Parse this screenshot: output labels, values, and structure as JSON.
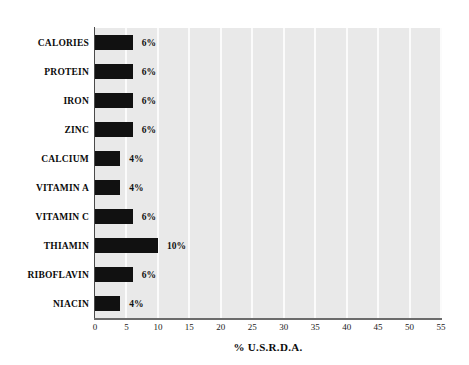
{
  "chart_data": {
    "type": "bar",
    "orientation": "horizontal",
    "title": "",
    "xlabel": "% U.S.R.D.A.",
    "ylabel": "",
    "xlim": [
      0,
      55
    ],
    "xticks": [
      0,
      5,
      10,
      15,
      20,
      25,
      30,
      35,
      40,
      45,
      50,
      55
    ],
    "xtick_labels": [
      "0",
      "5",
      "10",
      "15",
      "20",
      "25",
      "30",
      "35",
      "40",
      "45",
      "50",
      "55"
    ],
    "grid": "vertical-white-gridlines-every-5-units",
    "legend": "none",
    "categories": [
      "CALORIES",
      "PROTEIN",
      "IRON",
      "ZINC",
      "CALCIUM",
      "VITAMIN A",
      "VITAMIN C",
      "THIAMIN",
      "RIBOFLAVIN",
      "NIACIN"
    ],
    "values": [
      6,
      6,
      6,
      6,
      4,
      4,
      6,
      10,
      6,
      4
    ],
    "data_labels": [
      "6%",
      "6%",
      "6%",
      "6%",
      "4%",
      "4%",
      "6%",
      "10%",
      "6%",
      "4%"
    ],
    "bar_color": "#111111",
    "plot_background_color": "#e9e9e9",
    "gridline_color": "#fbfbfb",
    "page_background_color": "#ffffff"
  }
}
